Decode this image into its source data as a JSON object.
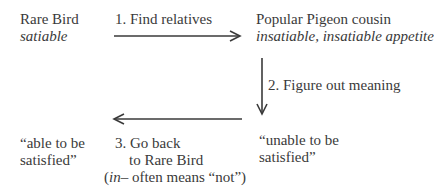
{
  "nodes": {
    "rare_bird": {
      "title": "Rare Bird",
      "word": "satiable"
    },
    "pigeon_cousin": {
      "title": "Popular Pigeon cousin",
      "words": "insatiable, insatiable appetite"
    },
    "unable": {
      "line1": "“unable to be",
      "line2": "satisfied”"
    },
    "able": {
      "line1": "“able to be",
      "line2": "satisfied”"
    }
  },
  "steps": {
    "step1": "1. Find relatives",
    "step2": "2. Figure out meaning",
    "step3_line1": "3. Go back",
    "step3_line2": "to Rare Bird",
    "step3_note_prefix": "(",
    "step3_note_italic": "in",
    "step3_note_rest": "– often means “not”)"
  },
  "colors": {
    "text": "#3a3a3a",
    "arrow": "#3a3a3a"
  }
}
